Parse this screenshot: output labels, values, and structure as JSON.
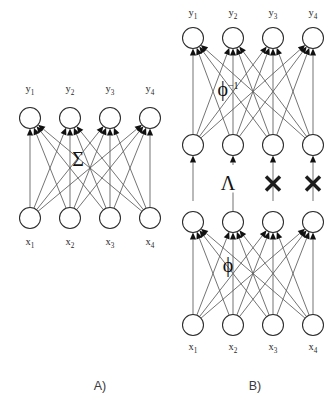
{
  "figure": {
    "background_color": "#ffffff",
    "width": 332,
    "height": 417,
    "panels": [
      {
        "id": "panel-a",
        "caption": "A)",
        "caption_x": 100,
        "caption_y": 390,
        "operator_label": "Σ",
        "operator_superscript": "",
        "operator_x": 78,
        "operator_y": 166,
        "output_labels": [
          "y",
          "y",
          "y",
          "y"
        ],
        "output_subscripts": [
          "1",
          "2",
          "3",
          "4"
        ],
        "input_labels": [
          "x",
          "x",
          "x",
          "x"
        ],
        "input_subscripts": [
          "1",
          "2",
          "3",
          "4"
        ],
        "node_xs": [
          30,
          70,
          110,
          150
        ],
        "output_row_y": 118,
        "input_row_y": 218,
        "output_label_y": 92,
        "input_label_y": 245,
        "node_radius": 10.5
      },
      {
        "id": "panel-b",
        "caption": "B)",
        "caption_x": 255,
        "caption_y": 390,
        "operator_top_label": "ϕ",
        "operator_top_superscript": "−1",
        "operator_top_x": 228,
        "operator_top_y": 96,
        "operator_mid_label": "Λ",
        "operator_mid_x": 228,
        "operator_mid_y": 190,
        "operator_bottom_label": "ϕ",
        "operator_bottom_x": 228,
        "operator_bottom_y": 272,
        "output_labels": [
          "y",
          "y",
          "y",
          "y"
        ],
        "output_subscripts": [
          "1",
          "2",
          "3",
          "4"
        ],
        "input_labels": [
          "x",
          "x",
          "x",
          "x"
        ],
        "input_subscripts": [
          "1",
          "2",
          "3",
          "4"
        ],
        "node_xs": [
          193,
          233,
          273,
          313
        ],
        "output_row_y": 38,
        "hidden_upper_row_y": 145,
        "hidden_lower_row_y": 222,
        "input_row_y": 325,
        "output_label_y": 16,
        "input_label_y": 350,
        "node_radius": 10.5,
        "channel_markers": [
          "none",
          "lambda",
          "cross",
          "cross"
        ]
      }
    ],
    "colors": {
      "node_stroke": "#2b2b2b",
      "node_fill": "#ffffff",
      "edge": "#5b5b5b",
      "arrowhead": "#111111",
      "cross": "#1c1c1c",
      "text": "#1f1f1f",
      "caption": "#3a3a3a"
    }
  }
}
